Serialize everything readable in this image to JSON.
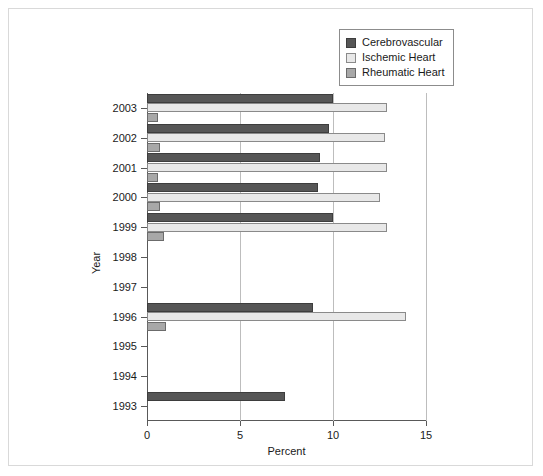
{
  "chart_data": {
    "type": "bar",
    "orientation": "horizontal",
    "title": "",
    "xlabel": "Percent",
    "ylabel": "Year",
    "xlim": [
      0,
      15
    ],
    "xticks": [
      0,
      5,
      10,
      15
    ],
    "xtick_labels": [
      "0",
      "5",
      "10",
      "15"
    ],
    "grid": "vertical",
    "legend_position": "top-right",
    "categories": [
      "2003",
      "2002",
      "2001",
      "2000",
      "1999",
      "1998",
      "1997",
      "1996",
      "1995",
      "1994",
      "1993"
    ],
    "series": [
      {
        "name": "Cerebrovascular",
        "color": "#565656",
        "values": [
          10.0,
          9.8,
          9.3,
          9.2,
          10.0,
          null,
          null,
          8.9,
          null,
          null,
          7.4
        ]
      },
      {
        "name": "Ischemic Heart",
        "color": "#e8e8e8",
        "values": [
          12.9,
          12.8,
          12.9,
          12.5,
          12.9,
          null,
          null,
          13.9,
          null,
          null,
          null
        ]
      },
      {
        "name": "Rheumatic Heart",
        "color": "#a8a8a8",
        "values": [
          0.6,
          0.7,
          0.6,
          0.7,
          0.9,
          null,
          null,
          1.0,
          null,
          null,
          null
        ]
      }
    ]
  },
  "legend": {
    "items": [
      {
        "label": "Cerebrovascular",
        "color": "#565656"
      },
      {
        "label": "Ischemic Heart",
        "color": "#e8e8e8"
      },
      {
        "label": "Rheumatic Heart",
        "color": "#a8a8a8"
      }
    ]
  },
  "axes": {
    "x_title": "Percent",
    "y_title": "Year"
  }
}
